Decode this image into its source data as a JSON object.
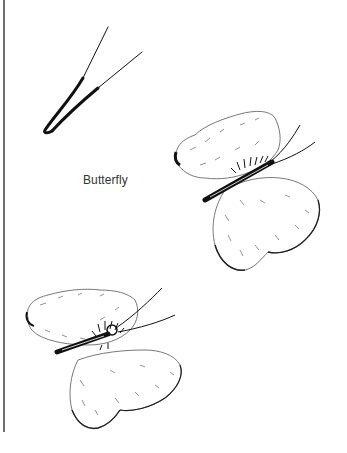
{
  "page": {
    "caption": "Butterfly",
    "colors": {
      "background": "#ffffff",
      "ink": "#111111",
      "rule": "#6e6e6e",
      "caption_text": "#333333"
    },
    "illustrations": [
      {
        "name": "antenna-sketch",
        "description": "Two curved lines (butterfly antennae/body detail)"
      },
      {
        "name": "butterfly-upper-right",
        "description": "Pencil-drawn butterfly, side view, upper right"
      },
      {
        "name": "butterfly-lower-left",
        "description": "Pencil-drawn butterfly, side view, lower left"
      }
    ]
  }
}
